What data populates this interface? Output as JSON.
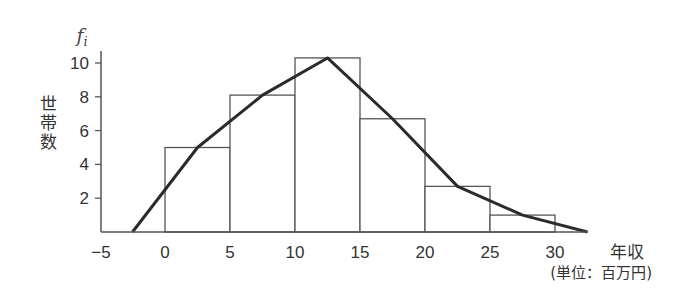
{
  "chart_data": {
    "type": "bar",
    "subtype": "histogram-with-frequency-polygon",
    "title": "",
    "xlabel": "年収",
    "x_unit": "(単位：百万円)",
    "ylabel": "世帯数",
    "ylabel_symbol": "f",
    "ylabel_symbol_sub": "i",
    "x_ticks": [
      -5,
      0,
      5,
      10,
      15,
      20,
      25,
      30
    ],
    "y_ticks": [
      2,
      4,
      6,
      8,
      10
    ],
    "xlim": [
      -5,
      33
    ],
    "ylim": [
      0,
      10.8
    ],
    "grid": false,
    "legend": null,
    "bins": [
      {
        "from": 0,
        "to": 5,
        "value": 5.0
      },
      {
        "from": 5,
        "to": 10,
        "value": 8.1
      },
      {
        "from": 10,
        "to": 15,
        "value": 10.3
      },
      {
        "from": 15,
        "to": 20,
        "value": 6.7
      },
      {
        "from": 20,
        "to": 25,
        "value": 2.7
      },
      {
        "from": 25,
        "to": 30,
        "value": 1.0
      }
    ],
    "categories": [
      "0-5",
      "5-10",
      "10-15",
      "15-20",
      "20-25",
      "25-30"
    ],
    "values": [
      5.0,
      8.1,
      10.3,
      6.7,
      2.7,
      1.0
    ],
    "frequency_polygon": {
      "x": [
        -2.5,
        2.5,
        7.5,
        12.5,
        17.5,
        22.5,
        27.5,
        32.5
      ],
      "y": [
        0,
        5.0,
        8.1,
        10.3,
        6.7,
        2.7,
        1.0,
        0
      ]
    }
  }
}
